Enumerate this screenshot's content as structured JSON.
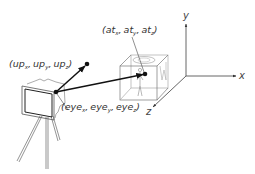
{
  "diagram": {
    "type": "camera-lookat-geometry",
    "colors": {
      "background": "#ffffff",
      "line_dark": "#111111",
      "line_light": "#888888",
      "text": "#333333"
    },
    "axes": {
      "x_label": "x",
      "y_label": "y",
      "z_label": "z"
    },
    "points": {
      "up": {
        "open": "(",
        "p1": "up",
        "s1": "x",
        "p2": "up",
        "s2": "y",
        "p3": "up",
        "s3": "z",
        "close": ")",
        "sep": ","
      },
      "at": {
        "open": "(",
        "p1": "at",
        "s1": "x",
        "p2": "at",
        "s2": "y",
        "p3": "at",
        "s3": "z",
        "close": ")",
        "sep": ","
      },
      "eye": {
        "open": "(",
        "p1": "eye",
        "s1": "x",
        "p2": "eye",
        "s2": "y",
        "p3": "eye",
        "s3": "z",
        "close": ")",
        "sep": ","
      }
    },
    "objects": [
      "camera-on-tripod",
      "cube-with-figures",
      "coordinate-axes"
    ],
    "arrows": [
      {
        "from": "eye",
        "to": "up"
      },
      {
        "from": "eye",
        "to": "at"
      }
    ]
  }
}
